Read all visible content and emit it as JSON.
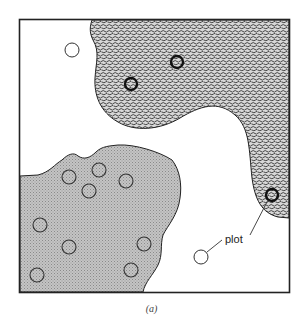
{
  "figure": {
    "caption": "(a)",
    "annotation": "plot",
    "colors": {
      "frame": "#222222",
      "stipple_region": "#8a8a8a",
      "grey_region": "#bdbdbd",
      "background": "#ffffff"
    }
  },
  "plots": {
    "open_circles": [
      {
        "x": 72,
        "y": 50
      },
      {
        "x": 201,
        "y": 257
      }
    ],
    "stipple_region_rings": [
      {
        "x": 131,
        "y": 84
      },
      {
        "x": 177,
        "y": 62
      },
      {
        "x": 272,
        "y": 195
      }
    ],
    "grey_region_circles": [
      {
        "x": 69,
        "y": 177
      },
      {
        "x": 99,
        "y": 170
      },
      {
        "x": 89,
        "y": 191
      },
      {
        "x": 126,
        "y": 181
      },
      {
        "x": 40,
        "y": 225
      },
      {
        "x": 69,
        "y": 247
      },
      {
        "x": 144,
        "y": 244
      },
      {
        "x": 131,
        "y": 270
      },
      {
        "x": 37,
        "y": 275
      }
    ]
  }
}
